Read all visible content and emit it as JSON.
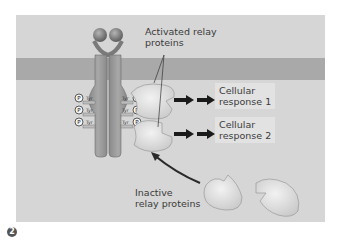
{
  "figure": {
    "step_number": "2",
    "labels": {
      "activated": "Activated relay\nproteins",
      "activated_line1": "Activated relay",
      "activated_line2": "proteins",
      "inactive_line1": "Inactive",
      "inactive_line2": "relay proteins"
    },
    "responses": [
      {
        "line1": "Cellular",
        "line2": "response 1"
      },
      {
        "line1": "Cellular",
        "line2": "response 2"
      }
    ],
    "receptor": {
      "phospho_sites_left": [
        "P",
        "P",
        "P"
      ],
      "phospho_sites_right": [
        "P",
        "P",
        "P"
      ],
      "residue_label": "Tyr"
    },
    "colors": {
      "background": "#d6d6d6",
      "membrane": "#a9a9a9",
      "receptor": "#9a9a9a",
      "relay_protein": "#e6e6e6",
      "arrow": "#1a1a1a",
      "text": "#3a3a3a"
    }
  }
}
